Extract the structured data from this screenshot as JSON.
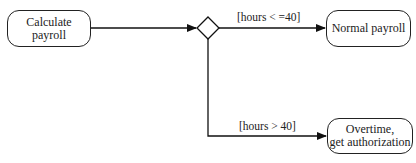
{
  "diagram": {
    "type": "activity-diagram",
    "nodes": {
      "start": {
        "label": "Calculate payroll"
      },
      "decision": {
        "label": ""
      },
      "normal": {
        "label": "Normal payroll"
      },
      "overtime": {
        "line1": "Overtime,",
        "line2": "get authorization"
      }
    },
    "edges": {
      "start_to_decision": {
        "label": ""
      },
      "to_normal": {
        "guard": "[hours < =40]"
      },
      "to_overtime": {
        "guard": "[hours > 40]"
      }
    }
  }
}
